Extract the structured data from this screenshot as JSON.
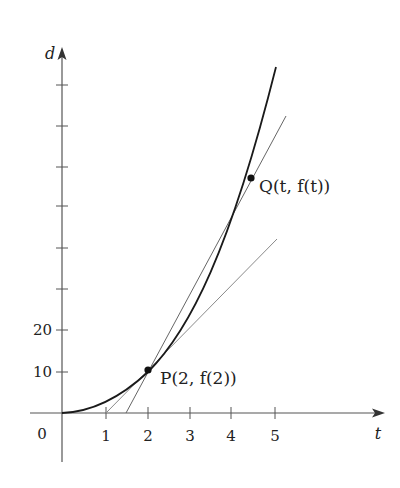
{
  "figure": {
    "axes": {
      "x_label": "t",
      "y_label": "d",
      "origin_label": "0",
      "x_ticks": [
        {
          "label": "1",
          "value": 1
        },
        {
          "label": "2",
          "value": 2
        },
        {
          "label": "3",
          "value": 3
        },
        {
          "label": "4",
          "value": 4
        },
        {
          "label": "5",
          "value": 5
        }
      ],
      "y_ticks": [
        {
          "label": "10",
          "value": 10
        },
        {
          "label": "20",
          "value": 20
        },
        {
          "label": "",
          "value": 30
        },
        {
          "label": "",
          "value": 40
        },
        {
          "label": "",
          "value": 50
        },
        {
          "label": "",
          "value": 60
        },
        {
          "label": "",
          "value": 70
        },
        {
          "label": "",
          "value": 80
        }
      ]
    },
    "points": {
      "P": {
        "label": "P(2, f(2))",
        "t": 2,
        "d": 10
      },
      "Q": {
        "label": "Q(t, f(t))",
        "t": 4.44,
        "d": 56.6
      }
    },
    "curve": {
      "name": "d = f(t)",
      "t_range": [
        0,
        5.02
      ]
    },
    "lines": [
      {
        "name": "secant-PQ",
        "through": [
          "P",
          "Q"
        ]
      },
      {
        "name": "tangent-at-P",
        "x_intercept": 1
      }
    ],
    "colors": {
      "axis": "#555555",
      "curve": "#1a1a1a",
      "secant": "#666666",
      "tangent": "#8a8a8a"
    }
  }
}
